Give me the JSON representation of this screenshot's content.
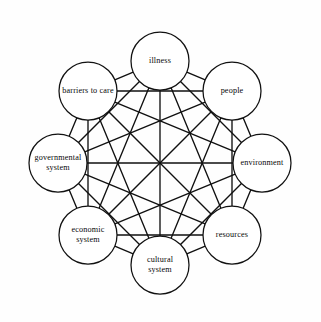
{
  "diagram": {
    "type": "complete-graph",
    "node_count": 8,
    "edge_count": 28,
    "layout": "octagonal-ring",
    "center": {
      "x": 160,
      "y": 163
    },
    "ring_radius": 102,
    "node_radius": 29,
    "colors": {
      "background": "#fefefe",
      "stroke": "#111111",
      "node_fill": "#ffffff",
      "edge": "#101010",
      "label": "#080808"
    },
    "nodes": [
      {
        "id": "illness",
        "label": "illness",
        "lines": [
          "illness"
        ],
        "position": "top",
        "angle_deg": -90,
        "cx": 160,
        "cy": 61
      },
      {
        "id": "people",
        "label": "people",
        "lines": [
          "people"
        ],
        "position": "top-right",
        "angle_deg": -45,
        "cx": 232,
        "cy": 91
      },
      {
        "id": "environment",
        "label": "environment",
        "lines": [
          "environment"
        ],
        "position": "right",
        "angle_deg": 0,
        "cx": 262,
        "cy": 163
      },
      {
        "id": "resources",
        "label": "resources",
        "lines": [
          "resources"
        ],
        "position": "bottom-right",
        "angle_deg": 45,
        "cx": 232,
        "cy": 235
      },
      {
        "id": "cultural-system",
        "label": "cultural system",
        "lines": [
          "cultural",
          "system"
        ],
        "position": "bottom",
        "angle_deg": 90,
        "cx": 160,
        "cy": 265
      },
      {
        "id": "economic-system",
        "label": "economic system",
        "lines": [
          "economic",
          "system"
        ],
        "position": "bottom-left",
        "angle_deg": 135,
        "cx": 88,
        "cy": 235
      },
      {
        "id": "governmental-system",
        "label": "governmental system",
        "lines": [
          "governmental",
          "system"
        ],
        "position": "left",
        "angle_deg": 180,
        "cx": 58,
        "cy": 163
      },
      {
        "id": "barriers-to-care",
        "label": "barriers to care",
        "lines": [
          "barriers to care"
        ],
        "position": "top-left",
        "angle_deg": -135,
        "cx": 88,
        "cy": 91
      }
    ],
    "edges": [
      [
        "illness",
        "people"
      ],
      [
        "illness",
        "environment"
      ],
      [
        "illness",
        "resources"
      ],
      [
        "illness",
        "cultural-system"
      ],
      [
        "illness",
        "economic-system"
      ],
      [
        "illness",
        "governmental-system"
      ],
      [
        "illness",
        "barriers-to-care"
      ],
      [
        "people",
        "environment"
      ],
      [
        "people",
        "resources"
      ],
      [
        "people",
        "cultural-system"
      ],
      [
        "people",
        "economic-system"
      ],
      [
        "people",
        "governmental-system"
      ],
      [
        "people",
        "barriers-to-care"
      ],
      [
        "environment",
        "resources"
      ],
      [
        "environment",
        "cultural-system"
      ],
      [
        "environment",
        "economic-system"
      ],
      [
        "environment",
        "governmental-system"
      ],
      [
        "environment",
        "barriers-to-care"
      ],
      [
        "resources",
        "cultural-system"
      ],
      [
        "resources",
        "economic-system"
      ],
      [
        "resources",
        "governmental-system"
      ],
      [
        "resources",
        "barriers-to-care"
      ],
      [
        "cultural-system",
        "economic-system"
      ],
      [
        "cultural-system",
        "governmental-system"
      ],
      [
        "cultural-system",
        "barriers-to-care"
      ],
      [
        "economic-system",
        "governmental-system"
      ],
      [
        "economic-system",
        "barriers-to-care"
      ],
      [
        "governmental-system",
        "barriers-to-care"
      ]
    ]
  }
}
